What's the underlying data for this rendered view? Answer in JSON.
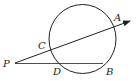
{
  "diagram": {
    "type": "geometry-circle-secants",
    "points": {
      "P": {
        "label": "P"
      },
      "A": {
        "label": "A"
      },
      "B": {
        "label": "B"
      },
      "C": {
        "label": "C"
      },
      "D": {
        "label": "D"
      }
    },
    "stroke_color": "#222222",
    "background": "#ffffff"
  }
}
